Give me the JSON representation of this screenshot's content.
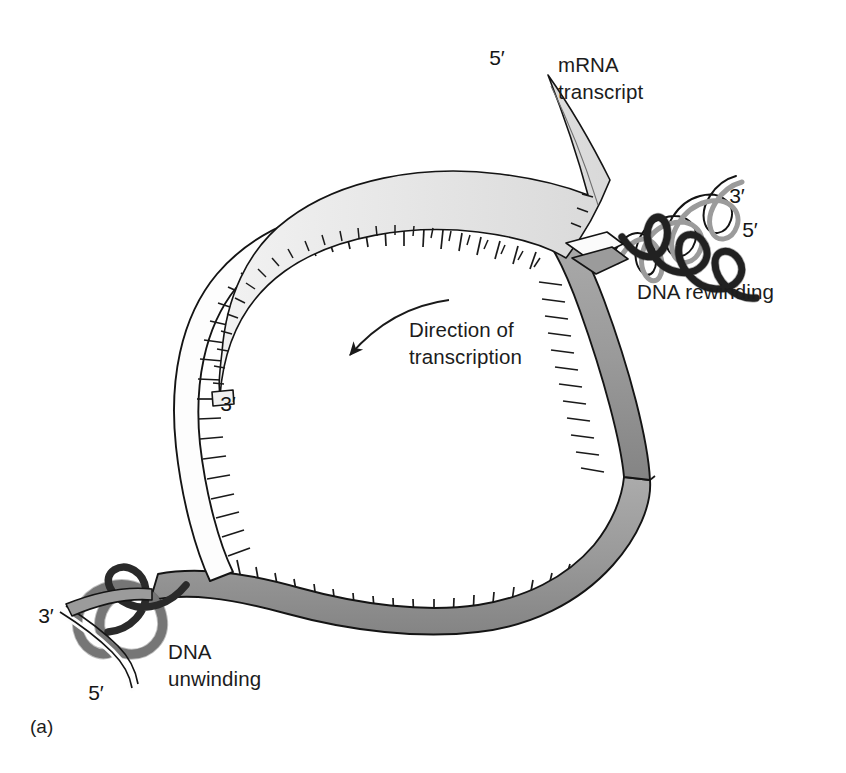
{
  "figure": {
    "panel_label": "(a)",
    "background_color": "#ffffff",
    "ink_color": "#1a1a1a",
    "title_present": false
  },
  "labels": {
    "mrna_transcript": "mRNA\ntranscript",
    "mrna_transcript_line1": "mRNA",
    "mrna_transcript_line2": "transcript",
    "direction_of_transcription_line1": "Direction of",
    "direction_of_transcription_line2": "transcription",
    "dna_rewinding": "DNA rewinding",
    "dna_unwinding_line1": "DNA",
    "dna_unwinding_line2": "unwinding"
  },
  "prime_markers": {
    "mrna_five_prime": "5′",
    "mrna_three_prime": "3′",
    "rewinding_three_prime": "3′",
    "rewinding_five_prime": "5′",
    "unwinding_three_prime": "3′",
    "unwinding_five_prime": "5′"
  },
  "colors": {
    "template_strand_gray": "#9b9b9b",
    "template_strand_gray_dark": "#8a8a8a",
    "coding_strand_white": "#fdfdfd",
    "mrna_ribbon": "#e8e8e8",
    "helix_dark_strand": "#2a2a2a",
    "outline": "#141414",
    "text": "#1c1c1c"
  },
  "elements": {
    "transcription_bubble": "open loop of separated DNA strands",
    "template_strand": "gray ribbon with base ticks forming lower and right arc of bubble",
    "coding_strand": "white ribbon with base ticks forming upper and left arc of bubble",
    "mrna_strand": "light gray ribbon inside bubble paired to template, exiting top right",
    "rewinding_helix": "double helix at upper right, about four turns",
    "unwinding_helix": "double helix at lower left, about two turns",
    "direction_arrow": "curved arrow pointing down-left into the bubble"
  }
}
